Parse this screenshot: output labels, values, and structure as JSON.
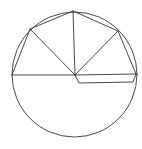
{
  "diagram": {
    "type": "geometry",
    "stroke_color": "#333333",
    "background": "#ffffff",
    "circle": {
      "cx": 74.5,
      "cy": 74.5,
      "r": 62.5
    },
    "center": {
      "x": 75,
      "y": 75
    },
    "vertices": {
      "left": {
        "x": 12,
        "y": 75
      },
      "upper_left": {
        "x": 30,
        "y": 29
      },
      "top": {
        "x": 73,
        "y": 11
      },
      "upper_right": {
        "x": 118,
        "y": 31
      },
      "right": {
        "x": 136,
        "y": 74
      }
    },
    "extra_path": [
      {
        "x": 75,
        "y": 75
      },
      {
        "x": 79,
        "y": 83
      },
      {
        "x": 133,
        "y": 82
      },
      {
        "x": 136,
        "y": 74
      }
    ]
  }
}
